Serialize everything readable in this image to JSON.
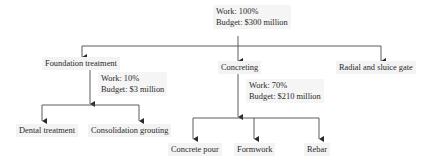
{
  "root": {
    "work": "Work: 100%",
    "budget": "Budget: $300 million"
  },
  "level1": [
    {
      "label": "Foundation treatment",
      "work": "Work: 10%",
      "budget": "Budget: $3 million",
      "children": [
        "Dental treatment",
        "Consolidation grouting"
      ]
    },
    {
      "label": "Concreting",
      "work": "Work: 70%",
      "budget": "Budget: $210 million",
      "children": [
        "Concrete pour",
        "Formwork",
        "Rebar"
      ]
    },
    {
      "label": "Radial and sluice gate"
    }
  ],
  "colors": {
    "line": "#3a3a3a",
    "box_bg": "#f3f3f3",
    "text": "#2a2a2a"
  }
}
